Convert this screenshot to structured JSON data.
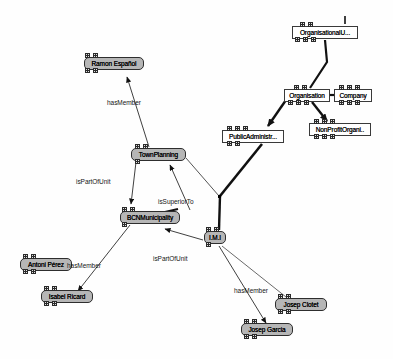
{
  "canvas": {
    "background": "#fefefe",
    "width": 393,
    "height": 359
  },
  "diagram": {
    "node_fill_class": "#ffffff",
    "node_fill_instance": "#b6b6b6",
    "node_border": "#2e2e2e",
    "edge_color": "#1a1a1a"
  },
  "nodes": [
    {
      "id": "organisationalunit",
      "label": "OrganisationalU...",
      "type": "class",
      "x": 292,
      "y": 26,
      "w": 66,
      "h": 13
    },
    {
      "id": "organisation",
      "label": "Organisation",
      "type": "class",
      "x": 284,
      "y": 89,
      "w": 46,
      "h": 13
    },
    {
      "id": "company",
      "label": "Company",
      "type": "class",
      "x": 334,
      "y": 89,
      "w": 38,
      "h": 13
    },
    {
      "id": "nonprofitorgani",
      "label": "NonProfitOrgani..",
      "type": "class",
      "x": 309,
      "y": 123,
      "w": 62,
      "h": 13
    },
    {
      "id": "publicadministr",
      "label": "PublicAdministr...",
      "type": "class",
      "x": 222,
      "y": 130,
      "w": 62,
      "h": 13
    },
    {
      "id": "ramonespanol",
      "label": "Ramon Español",
      "type": "instance",
      "x": 84,
      "y": 57,
      "w": 60,
      "h": 13
    },
    {
      "id": "townplanning",
      "label": "TownPlanning",
      "type": "instance",
      "x": 131,
      "y": 148,
      "w": 55,
      "h": 13
    },
    {
      "id": "bcnmunicipality",
      "label": "BCNMunicipality",
      "type": "instance",
      "x": 120,
      "y": 211,
      "w": 60,
      "h": 13
    },
    {
      "id": "imi",
      "label": "I.M.I",
      "type": "instance",
      "x": 204,
      "y": 231,
      "w": 22,
      "h": 13
    },
    {
      "id": "antoniperez",
      "label": "Antoni Pérez",
      "type": "instance",
      "x": 20,
      "y": 258,
      "w": 52,
      "h": 13
    },
    {
      "id": "isabelricard",
      "label": "Isabel Ricard",
      "type": "instance",
      "x": 41,
      "y": 290,
      "w": 52,
      "h": 13
    },
    {
      "id": "josepclotet",
      "label": "Josep Clotet",
      "type": "instance",
      "x": 275,
      "y": 298,
      "w": 52,
      "h": 13
    },
    {
      "id": "josepgarcia",
      "label": "Josep Garcia",
      "type": "instance",
      "x": 241,
      "y": 323,
      "w": 52,
      "h": 13
    }
  ],
  "edges": [
    {
      "id": "e-townplanning-ramonespanol",
      "label": "hasMember",
      "from": "townplanning",
      "to": "ramonespanol"
    },
    {
      "id": "e-townplanning-bcnmunicipality",
      "label": "isPartOfUnit",
      "from": "townplanning",
      "to": "bcnmunicipality"
    },
    {
      "id": "e-imi-townplanning",
      "label": "isSuperiorTo",
      "from": "imi",
      "to": "townplanning"
    },
    {
      "id": "e-imi-bcnmunicipality",
      "label": "isPartOfUnit",
      "from": "imi",
      "to": "bcnmunicipality"
    },
    {
      "id": "e-bcnmunicipality-isabelricard",
      "label": "hasMember",
      "from": "bcnmunicipality",
      "to": "isabelricard"
    },
    {
      "id": "e-imi-josepgarcia",
      "label": "hasMember",
      "from": "imi",
      "to": "josepgarcia"
    },
    {
      "id": "e-organisationalunit-organisation",
      "label": "",
      "from": "organisationalunit",
      "to": "organisation"
    },
    {
      "id": "e-organisation-company",
      "label": "",
      "from": "organisation",
      "to": "company"
    },
    {
      "id": "e-organisation-nonprofitorgani",
      "label": "",
      "from": "organisation",
      "to": "nonprofitorgani"
    },
    {
      "id": "e-organisation-publicadministr",
      "label": "",
      "from": "organisation",
      "to": "publicadministr"
    }
  ],
  "edge_labels": [
    {
      "id": "lbl-hasmember-1",
      "text": "hasMember",
      "x": 107,
      "y": 99
    },
    {
      "id": "lbl-ispartofunit-1",
      "text": "isPartOfUnit",
      "x": 76,
      "y": 178
    },
    {
      "id": "lbl-issuperiorto",
      "text": "isSuperiorTo",
      "x": 158,
      "y": 198
    },
    {
      "id": "lbl-ispartofunit-2",
      "text": "isPartOfUnit",
      "x": 153,
      "y": 255
    },
    {
      "id": "lbl-hasmember-2",
      "text": "hasMember",
      "x": 67,
      "y": 262
    },
    {
      "id": "lbl-hasmember-3",
      "text": "hasMember",
      "x": 234,
      "y": 287
    }
  ]
}
